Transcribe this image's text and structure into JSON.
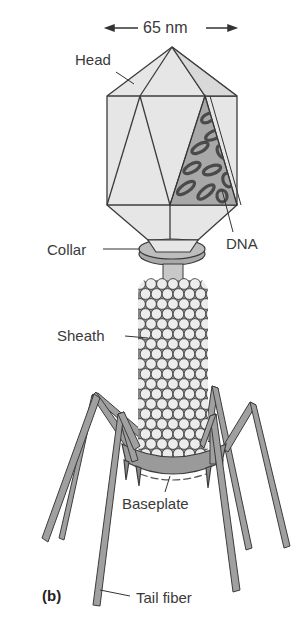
{
  "figure": {
    "panel_label": "(b)",
    "dimension": {
      "label": "65 nm",
      "arrow_left": "←",
      "arrow_right": "→"
    },
    "labels": {
      "head": "Head",
      "dna": "DNA",
      "collar": "Collar",
      "sheath": "Sheath",
      "baseplate": "Baseplate",
      "tail_fiber": "Tail fiber"
    },
    "colors": {
      "head_fill": "#e6e6e6",
      "outline": "#3c3c3c",
      "collar_fill": "#b5b5b5",
      "sheath_bead": "#ececec",
      "sheath_bg": "#8a8a8a",
      "leg_fill": "#9c9c9c",
      "dna_bg": "#a8a8a8",
      "dna_strand": "#5a5a5a"
    }
  }
}
